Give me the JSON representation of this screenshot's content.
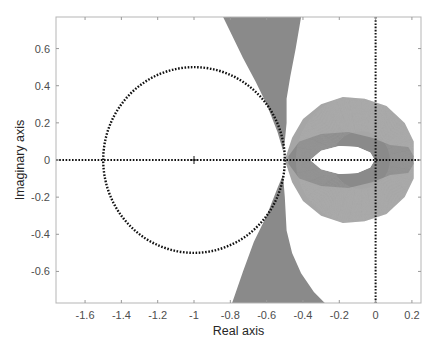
{
  "chart_data": {
    "type": "line",
    "title": "",
    "xlabel": "Real axis",
    "ylabel": "Imaginary axis",
    "xlim": [
      -1.76,
      0.25
    ],
    "ylim": [
      -0.77,
      0.77
    ],
    "xticks": [
      -1.6,
      -1.4,
      -1.2,
      -1,
      -0.8,
      -0.6,
      -0.4,
      -0.2,
      0,
      0.2
    ],
    "xtick_labels": [
      "-1.6",
      "-1.4",
      "-1.2",
      "-1",
      "-0.8",
      "-0.6",
      "-0.4",
      "-0.2",
      "0",
      "0.2"
    ],
    "yticks": [
      -0.6,
      -0.4,
      -0.2,
      0,
      0.2,
      0.4,
      0.6
    ],
    "ytick_labels": [
      "-0.6",
      "-0.4",
      "-0.2",
      "0",
      "0.2",
      "0.4",
      "0.6"
    ],
    "grid": false,
    "colors": {
      "band": "#8a8a8a",
      "band_light": "#a6a6a6",
      "reference": "#111111",
      "axes": "#b0b0b0"
    },
    "reference_circle": {
      "name": "unit-margin circle",
      "center": [
        -1,
        0
      ],
      "radius": 0.5,
      "style": "dotted"
    },
    "critical_point": {
      "name": "critical point",
      "x": -1,
      "y": 0,
      "marker": "+"
    },
    "reference_lines": [
      {
        "name": "real-axis line",
        "orientation": "horizontal",
        "value": 0,
        "style": "dotted"
      },
      {
        "name": "imaginary-axis line",
        "orientation": "vertical",
        "value": 0,
        "style": "dotted"
      }
    ],
    "series": [
      {
        "name": "upper-wing-band",
        "points": [
          [
            -0.84,
            0.77
          ],
          [
            -0.41,
            0.77
          ],
          [
            -0.44,
            0.6
          ],
          [
            -0.47,
            0.45
          ],
          [
            -0.49,
            0.33
          ],
          [
            -0.49,
            0.2
          ],
          [
            -0.5,
            0.1
          ],
          [
            -0.51,
            0.05
          ],
          [
            -0.54,
            0.15
          ],
          [
            -0.6,
            0.3
          ],
          [
            -0.66,
            0.42
          ],
          [
            -0.73,
            0.55
          ],
          [
            -0.79,
            0.67
          ]
        ]
      },
      {
        "name": "lower-wing-band",
        "points": [
          [
            -0.79,
            -0.77
          ],
          [
            -0.28,
            -0.77
          ],
          [
            -0.34,
            -0.71
          ],
          [
            -0.41,
            -0.61
          ],
          [
            -0.46,
            -0.5
          ],
          [
            -0.49,
            -0.38
          ],
          [
            -0.5,
            -0.2
          ],
          [
            -0.51,
            -0.08
          ],
          [
            -0.54,
            -0.15
          ],
          [
            -0.6,
            -0.3
          ],
          [
            -0.67,
            -0.44
          ],
          [
            -0.73,
            -0.6
          ]
        ]
      },
      {
        "name": "loop-band-outer",
        "points": [
          [
            -0.5,
            0.0
          ],
          [
            -0.46,
            0.12
          ],
          [
            -0.4,
            0.22
          ],
          [
            -0.3,
            0.3
          ],
          [
            -0.18,
            0.34
          ],
          [
            -0.06,
            0.33
          ],
          [
            0.06,
            0.29
          ],
          [
            0.16,
            0.2
          ],
          [
            0.21,
            0.1
          ],
          [
            0.21,
            0.02
          ],
          [
            0.19,
            0.0
          ],
          [
            0.21,
            -0.02
          ],
          [
            0.21,
            -0.1
          ],
          [
            0.16,
            -0.2
          ],
          [
            0.06,
            -0.29
          ],
          [
            -0.06,
            -0.33
          ],
          [
            -0.18,
            -0.34
          ],
          [
            -0.3,
            -0.3
          ],
          [
            -0.4,
            -0.22
          ],
          [
            -0.46,
            -0.12
          ]
        ]
      },
      {
        "name": "loop-band-inner-hole",
        "points": [
          [
            -0.36,
            0.0
          ],
          [
            -0.3,
            0.05
          ],
          [
            -0.2,
            0.075
          ],
          [
            -0.1,
            0.07
          ],
          [
            -0.03,
            0.04
          ],
          [
            -0.005,
            0.0
          ],
          [
            -0.03,
            -0.04
          ],
          [
            -0.1,
            -0.07
          ],
          [
            -0.2,
            -0.075
          ],
          [
            -0.3,
            -0.05
          ]
        ]
      },
      {
        "name": "loop-band-dense-ring",
        "points": [
          [
            -0.48,
            0.02
          ],
          [
            -0.42,
            0.1
          ],
          [
            -0.3,
            0.14
          ],
          [
            -0.15,
            0.15
          ],
          [
            -0.02,
            0.12
          ],
          [
            0.08,
            0.08
          ],
          [
            0.18,
            0.07
          ],
          [
            0.21,
            0.02
          ],
          [
            0.21,
            -0.02
          ],
          [
            0.18,
            -0.07
          ],
          [
            0.08,
            -0.08
          ],
          [
            -0.02,
            -0.12
          ],
          [
            -0.15,
            -0.15
          ],
          [
            -0.3,
            -0.14
          ],
          [
            -0.42,
            -0.1
          ],
          [
            -0.48,
            -0.02
          ]
        ]
      }
    ]
  }
}
